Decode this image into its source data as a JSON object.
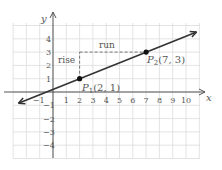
{
  "chart_data": {
    "type": "line",
    "title": "",
    "xlabel": "x",
    "ylabel": "y",
    "xlim": [
      -3,
      11
    ],
    "ylim": [
      -5,
      5
    ],
    "x_ticks": [
      -1,
      1,
      2,
      3,
      4,
      5,
      6,
      7,
      8,
      9,
      10
    ],
    "y_ticks": [
      4,
      3,
      2,
      1,
      -1,
      -2,
      -3,
      -4
    ],
    "grid": true,
    "line": {
      "slope": 0.4,
      "intercept": 0.2,
      "arrows": "both"
    },
    "points": [
      {
        "name": "P1",
        "label": "P₁(2, 1)",
        "x": 2,
        "y": 1
      },
      {
        "name": "P2",
        "label": "P₂(7, 3)",
        "x": 7,
        "y": 3
      }
    ],
    "annotations": [
      {
        "text": "rise",
        "type": "dashed-vertical",
        "from": [
          2,
          1
        ],
        "to": [
          2,
          3
        ]
      },
      {
        "text": "run",
        "type": "dashed-horizontal",
        "from": [
          2,
          3
        ],
        "to": [
          7,
          3
        ]
      }
    ]
  },
  "labels": {
    "x_axis": "x",
    "y_axis": "y",
    "rise": "rise",
    "run": "run",
    "p1_main": "P",
    "p1_sub": "1",
    "p1_coords": "(2, 1)",
    "p2_main": "P",
    "p2_sub": "2",
    "p2_coords": "(7, 3)"
  },
  "colors": {
    "grid": "#dcdcdc",
    "axis": "#555555",
    "line": "#333333",
    "dashed": "#666666"
  }
}
